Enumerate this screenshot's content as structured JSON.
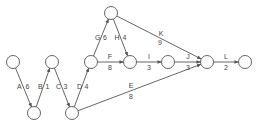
{
  "diagram": {
    "type": "activity-on-arrow network",
    "nodes": [
      {
        "id": "n1",
        "x": 13,
        "y": 62
      },
      {
        "id": "n2",
        "x": 34,
        "y": 113
      },
      {
        "id": "n3",
        "x": 52,
        "y": 62
      },
      {
        "id": "n4",
        "x": 72,
        "y": 113
      },
      {
        "id": "n5",
        "x": 91,
        "y": 62
      },
      {
        "id": "n6",
        "x": 111,
        "y": 13
      },
      {
        "id": "n7",
        "x": 130,
        "y": 62
      },
      {
        "id": "n8",
        "x": 168,
        "y": 62
      },
      {
        "id": "n9",
        "x": 207,
        "y": 62
      },
      {
        "id": "n10",
        "x": 245,
        "y": 62
      }
    ],
    "edges": [
      {
        "id": "A",
        "activity": "A",
        "duration": "6",
        "from": "n1",
        "to": "n2"
      },
      {
        "id": "B",
        "activity": "B",
        "duration": "1",
        "from": "n2",
        "to": "n3"
      },
      {
        "id": "C",
        "activity": "C",
        "duration": "3",
        "from": "n3",
        "to": "n4"
      },
      {
        "id": "D",
        "activity": "D",
        "duration": "4",
        "from": "n4",
        "to": "n5"
      },
      {
        "id": "G",
        "activity": "G",
        "duration": "6",
        "from": "n5",
        "to": "n6"
      },
      {
        "id": "H",
        "activity": "H",
        "duration": "4",
        "from": "n6",
        "to": "n7"
      },
      {
        "id": "F",
        "activity": "F",
        "duration": "8",
        "from": "n5",
        "to": "n7"
      },
      {
        "id": "I",
        "activity": "I",
        "duration": "3",
        "from": "n7",
        "to": "n8"
      },
      {
        "id": "J",
        "activity": "J",
        "duration": "3",
        "from": "n8",
        "to": "n9"
      },
      {
        "id": "K",
        "activity": "K",
        "duration": "9",
        "from": "n6",
        "to": "n9"
      },
      {
        "id": "E",
        "activity": "E",
        "duration": "8",
        "from": "n4",
        "to": "n9"
      },
      {
        "id": "L",
        "activity": "L",
        "duration": "2",
        "from": "n9",
        "to": "n10"
      }
    ],
    "colors": {
      "stroke": "#555555",
      "text": "#444444",
      "background": "#ffffff"
    }
  }
}
